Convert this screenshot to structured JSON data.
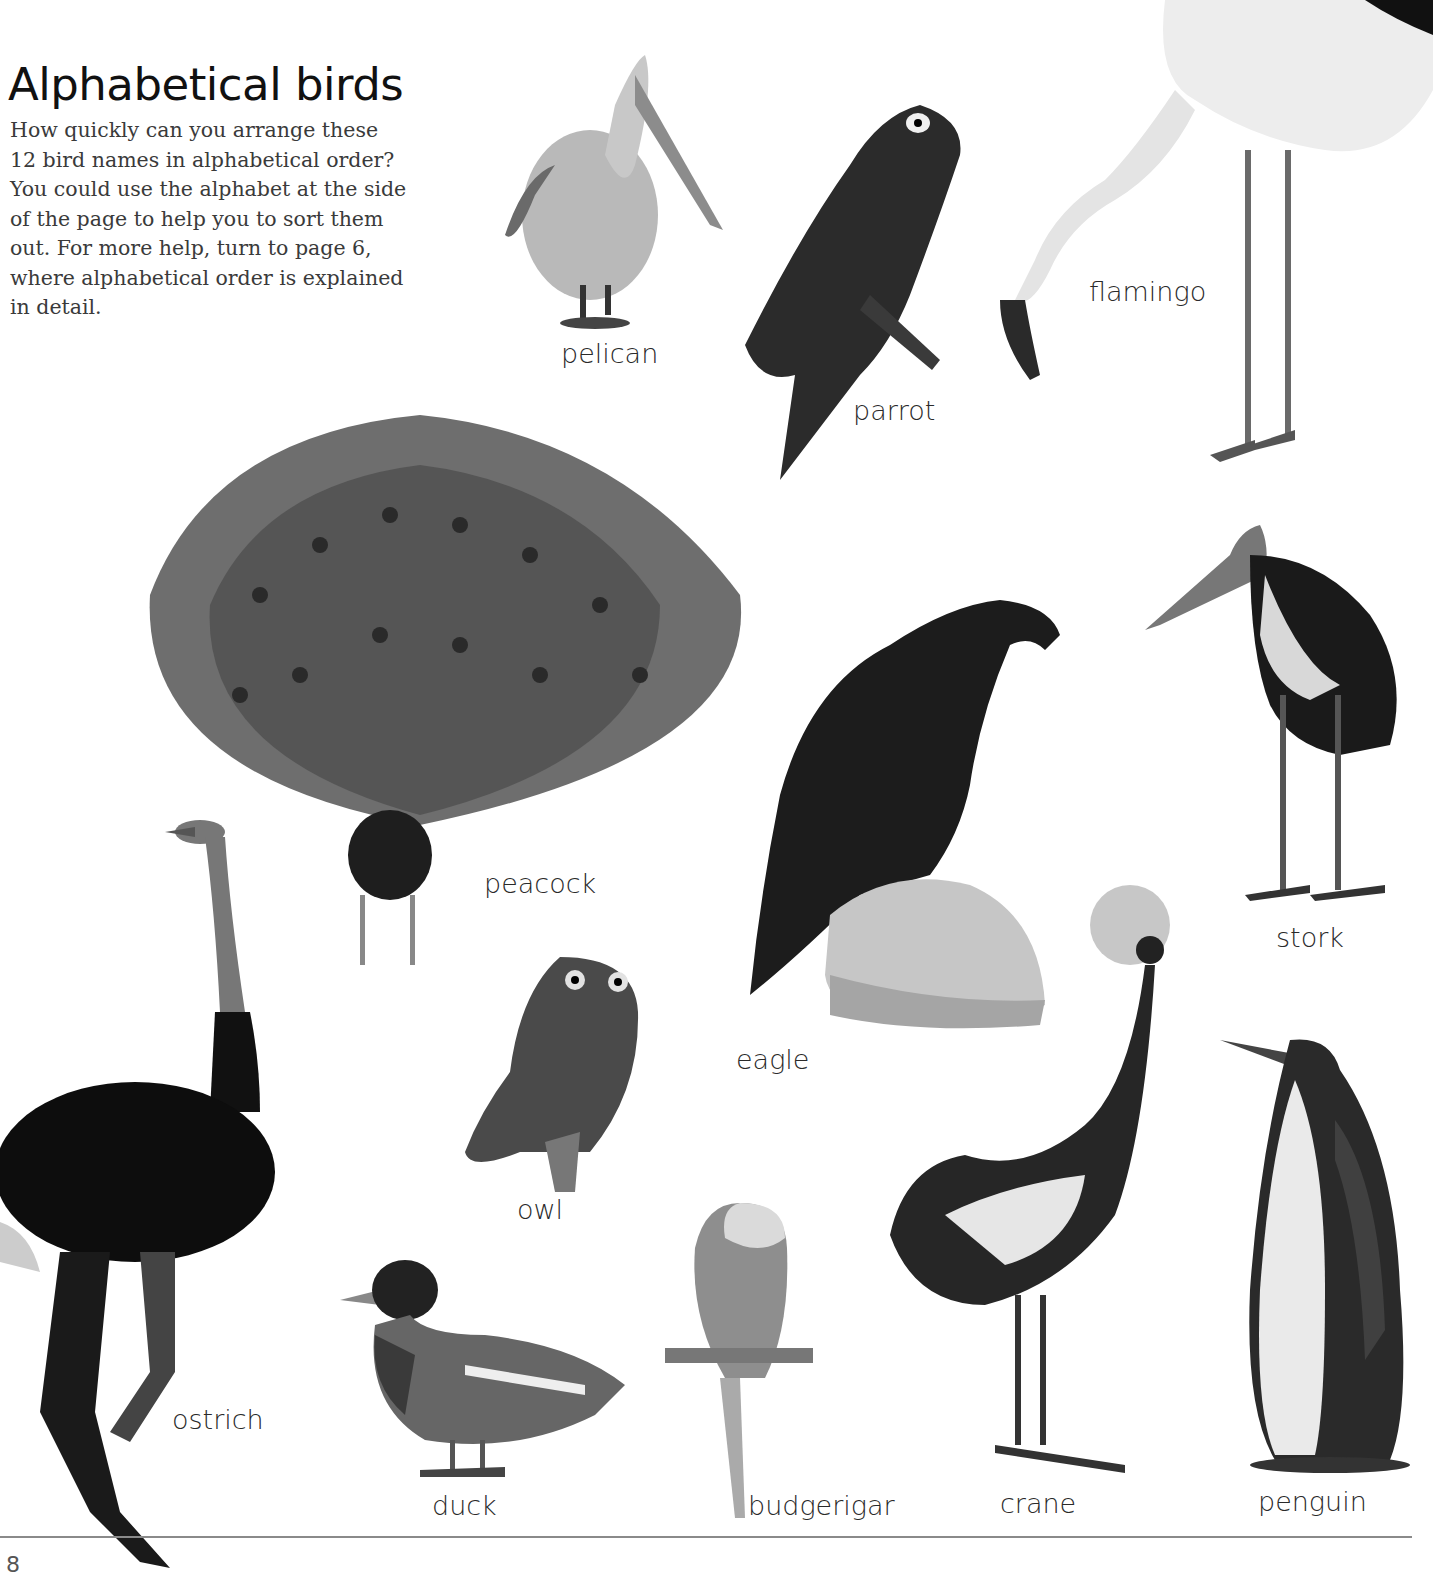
{
  "page": {
    "title": "Alphabetical birds",
    "intro": "How quickly can you arrange these 12 bird names in alphabetical order? You could use the alphabet at the side of the page to help you to sort them out. For more help, turn to page 6, where alphabetical order is explained in detail.",
    "page_number": "8"
  },
  "birds": [
    {
      "name": "pelican"
    },
    {
      "name": "parrot"
    },
    {
      "name": "flamingo"
    },
    {
      "name": "peacock"
    },
    {
      "name": "stork"
    },
    {
      "name": "eagle"
    },
    {
      "name": "owl"
    },
    {
      "name": "ostrich"
    },
    {
      "name": "duck"
    },
    {
      "name": "budgerigar"
    },
    {
      "name": "crane"
    },
    {
      "name": "penguin"
    }
  ]
}
